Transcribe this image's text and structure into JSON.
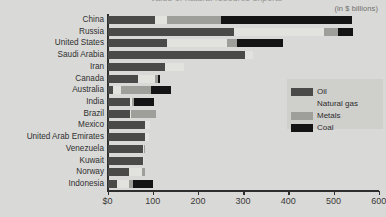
{
  "title": "Value of natural resource exports",
  "units_note": "(in $ billions)",
  "legend": {
    "position": "inside-right",
    "items": [
      {
        "label": "Oil",
        "color": "#4a4a48",
        "swatch": "oil-swatch"
      },
      {
        "label": "Natural gas",
        "color": "#e2e2df",
        "swatch": "natural-gas-swatch"
      },
      {
        "label": "Metals",
        "color": "#9e9e9a",
        "swatch": "metals-swatch"
      },
      {
        "label": "Coal",
        "color": "#141414",
        "swatch": "coal-swatch"
      }
    ]
  },
  "axis": {
    "x_ticks": [
      "$0",
      "100",
      "200",
      "300",
      "400",
      "500",
      "600"
    ],
    "x_tick_values": [
      0,
      100,
      200,
      300,
      400,
      500,
      600
    ],
    "x_min": 0,
    "x_max": 600
  },
  "chart_data": {
    "type": "bar",
    "orientation": "horizontal",
    "stacked": true,
    "title": "Value of natural resource exports",
    "subtitle": "(in $ billions)",
    "xlabel": "",
    "ylabel": "",
    "xlim": [
      0,
      600
    ],
    "grid": false,
    "legend_position": "inside-right",
    "categories": [
      "China",
      "Russia",
      "United States",
      "Saudi Arabia",
      "Iran",
      "Canada",
      "Australia",
      "India",
      "Brazil",
      "Mexico",
      "United Arab Emirates",
      "Venezuela",
      "Kuwait",
      "Norway",
      "Indonesia"
    ],
    "series": [
      {
        "name": "Oil",
        "color": "#4a4a48",
        "values": [
          129,
          345,
          162,
          375,
          156,
          82,
          14,
          60,
          60,
          101,
          101,
          96,
          96,
          58,
          25
        ]
      },
      {
        "name": "Natural gas",
        "color": "#e2e2df",
        "values": [
          33,
          247,
          164,
          22,
          52,
          47,
          22,
          5,
          3,
          14,
          11,
          3,
          3,
          36,
          33
        ]
      },
      {
        "name": "Metals",
        "color": "#9e9e9a",
        "values": [
          148,
          38,
          27,
          0,
          0,
          8,
          82,
          5,
          68,
          0,
          0,
          3,
          0,
          8,
          11
        ]
      },
      {
        "name": "Coal",
        "color": "#141414",
        "values": [
          359,
          41,
          126,
          0,
          0,
          5,
          55,
          55,
          0,
          0,
          0,
          0,
          0,
          0,
          55
        ]
      }
    ],
    "totals": [
      669,
      671,
      479,
      397,
      208,
      142,
      173,
      125,
      131,
      115,
      112,
      102,
      99,
      102,
      124
    ]
  },
  "bars": [
    {
      "category": "China",
      "segments": [
        {
          "k": "oil",
          "px": 47
        },
        {
          "k": "gas",
          "px": 12
        },
        {
          "k": "metals",
          "px": 54
        },
        {
          "k": "coal",
          "px": 131
        }
      ]
    },
    {
      "category": "Russia",
      "segments": [
        {
          "k": "oil",
          "px": 126
        },
        {
          "k": "gas",
          "px": 90
        },
        {
          "k": "metals",
          "px": 14
        },
        {
          "k": "coal",
          "px": 15
        }
      ]
    },
    {
      "category": "United States",
      "segments": [
        {
          "k": "oil",
          "px": 59
        },
        {
          "k": "gas",
          "px": 60
        },
        {
          "k": "metals",
          "px": 10
        },
        {
          "k": "coal",
          "px": 46
        }
      ]
    },
    {
      "category": "Saudi Arabia",
      "segments": [
        {
          "k": "oil",
          "px": 137
        },
        {
          "k": "gas",
          "px": 8
        },
        {
          "k": "metals",
          "px": 0
        },
        {
          "k": "coal",
          "px": 0
        }
      ]
    },
    {
      "category": "Iran",
      "segments": [
        {
          "k": "oil",
          "px": 57
        },
        {
          "k": "gas",
          "px": 19
        },
        {
          "k": "metals",
          "px": 0
        },
        {
          "k": "coal",
          "px": 0
        }
      ]
    },
    {
      "category": "Canada",
      "segments": [
        {
          "k": "oil",
          "px": 30
        },
        {
          "k": "gas",
          "px": 17
        },
        {
          "k": "metals",
          "px": 3
        },
        {
          "k": "coal",
          "px": 2
        }
      ]
    },
    {
      "category": "Australia",
      "segments": [
        {
          "k": "oil",
          "px": 5
        },
        {
          "k": "gas",
          "px": 8
        },
        {
          "k": "metals",
          "px": 30
        },
        {
          "k": "coal",
          "px": 20
        }
      ]
    },
    {
      "category": "India",
      "segments": [
        {
          "k": "oil",
          "px": 22
        },
        {
          "k": "gas",
          "px": 2
        },
        {
          "k": "metals",
          "px": 2
        },
        {
          "k": "coal",
          "px": 20
        }
      ]
    },
    {
      "category": "Brazil",
      "segments": [
        {
          "k": "oil",
          "px": 22
        },
        {
          "k": "gas",
          "px": 1
        },
        {
          "k": "metals",
          "px": 25
        },
        {
          "k": "coal",
          "px": 0
        }
      ]
    },
    {
      "category": "Mexico",
      "segments": [
        {
          "k": "oil",
          "px": 37
        },
        {
          "k": "gas",
          "px": 5
        },
        {
          "k": "metals",
          "px": 0
        },
        {
          "k": "coal",
          "px": 0
        }
      ]
    },
    {
      "category": "United Arab Emirates",
      "segments": [
        {
          "k": "oil",
          "px": 37
        },
        {
          "k": "gas",
          "px": 4
        },
        {
          "k": "metals",
          "px": 0
        },
        {
          "k": "coal",
          "px": 0
        }
      ]
    },
    {
      "category": "Venezuela",
      "segments": [
        {
          "k": "oil",
          "px": 35
        },
        {
          "k": "gas",
          "px": 1
        },
        {
          "k": "metals",
          "px": 1
        },
        {
          "k": "coal",
          "px": 0
        }
      ]
    },
    {
      "category": "Kuwait",
      "segments": [
        {
          "k": "oil",
          "px": 35
        },
        {
          "k": "gas",
          "px": 1
        },
        {
          "k": "metals",
          "px": 0
        },
        {
          "k": "coal",
          "px": 0
        }
      ]
    },
    {
      "category": "Norway",
      "segments": [
        {
          "k": "oil",
          "px": 21
        },
        {
          "k": "gas",
          "px": 13
        },
        {
          "k": "metals",
          "px": 3
        },
        {
          "k": "coal",
          "px": 0
        }
      ]
    },
    {
      "category": "Indonesia",
      "segments": [
        {
          "k": "oil",
          "px": 9
        },
        {
          "k": "gas",
          "px": 12
        },
        {
          "k": "metals",
          "px": 4
        },
        {
          "k": "coal",
          "px": 20
        }
      ]
    }
  ]
}
